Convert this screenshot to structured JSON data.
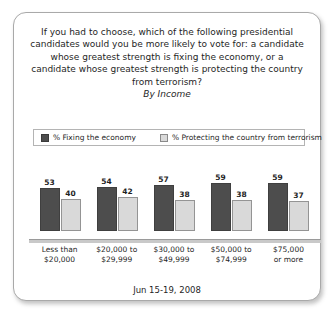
{
  "panel": {
    "question": "If you had to choose, which of the following presidential candidates would you be more likely to vote for: a candidate whose greatest strength is fixing the economy, or a candidate whose greatest strength is protecting the country from terrorism?",
    "subtitle": "By Income",
    "footer_date": "Jun 15-19, 2008"
  },
  "legend": {
    "series1_label": "% Fixing the economy",
    "series2_label": "% Protecting the country from terrorism",
    "series1_color": "#4d4d4d",
    "series2_color": "#d9d9d9"
  },
  "chart_data": {
    "type": "bar",
    "title": "If you had to choose, which of the following presidential candidates would you be more likely to vote for: a candidate whose greatest strength is fixing the economy, or a candidate whose greatest strength is protecting the country from terrorism?",
    "subtitle": "By Income",
    "xlabel": "",
    "ylabel": "",
    "ylim": [
      0,
      100
    ],
    "grid": false,
    "legend_position": "top",
    "categories": [
      "Less than $20,000",
      "$20,000 to $29,999",
      "$30,000 to $49,999",
      "$50,000 to $74,999",
      "$75,000 or more"
    ],
    "category_lines": [
      [
        "Less than",
        "$20,000"
      ],
      [
        "$20,000 to",
        "$29,999"
      ],
      [
        "$30,000 to",
        "$49,999"
      ],
      [
        "$50,000 to",
        "$74,999"
      ],
      [
        "$75,000",
        "or more"
      ]
    ],
    "series": [
      {
        "name": "% Fixing the economy",
        "color": "#4d4d4d",
        "values": [
          53,
          54,
          57,
          59,
          59
        ]
      },
      {
        "name": "% Protecting the country from terrorism",
        "color": "#d9d9d9",
        "values": [
          40,
          42,
          38,
          38,
          37
        ]
      }
    ],
    "annotation": "Jun 15-19, 2008"
  }
}
